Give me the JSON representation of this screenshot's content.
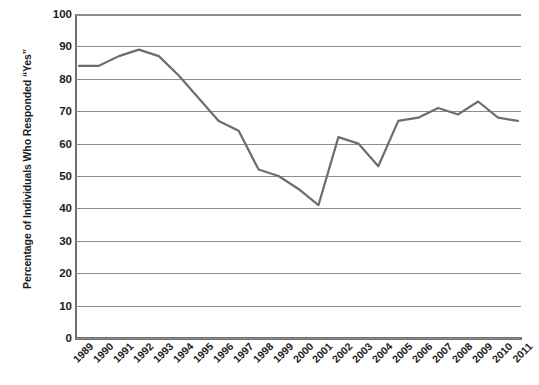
{
  "chart_data": {
    "type": "line",
    "title": "",
    "xlabel": "",
    "ylabel": "Percentage of Individuals Who Responded “Yes”",
    "ylim": [
      0,
      100
    ],
    "ytick_values": [
      0,
      10,
      20,
      30,
      40,
      50,
      60,
      70,
      80,
      90,
      100
    ],
    "ytick_labels": [
      "0",
      "10",
      "20",
      "30",
      "40",
      "50",
      "60",
      "70",
      "80",
      "90",
      "100"
    ],
    "grid": true,
    "legend": "none",
    "categories": [
      "1989",
      "1990",
      "1991",
      "1992",
      "1993",
      "1994",
      "1995",
      "1996",
      "1997",
      "1998",
      "1999",
      "2000",
      "2001",
      "2002",
      "2003",
      "2004",
      "2005",
      "2006",
      "2007",
      "2008",
      "2009",
      "2010",
      "2011"
    ],
    "values": [
      84,
      84,
      87,
      89,
      87,
      81,
      74,
      67,
      64,
      52,
      50,
      46,
      41,
      62,
      60,
      53,
      67,
      68,
      71,
      69,
      73,
      68,
      67
    ],
    "series": [
      {
        "name": "Percentage of Individuals Who Responded “Yes”",
        "color": "#6d6d6d",
        "values": [
          84,
          84,
          87,
          89,
          87,
          81,
          74,
          67,
          64,
          52,
          50,
          46,
          41,
          62,
          60,
          53,
          67,
          68,
          71,
          69,
          73,
          68,
          67
        ]
      }
    ]
  },
  "colors": {
    "line": "#6d6d6d",
    "grid": "#8d8d8d",
    "axis": "#6f6f6f",
    "text": "#1c1c1c",
    "background": "#ffffff"
  }
}
